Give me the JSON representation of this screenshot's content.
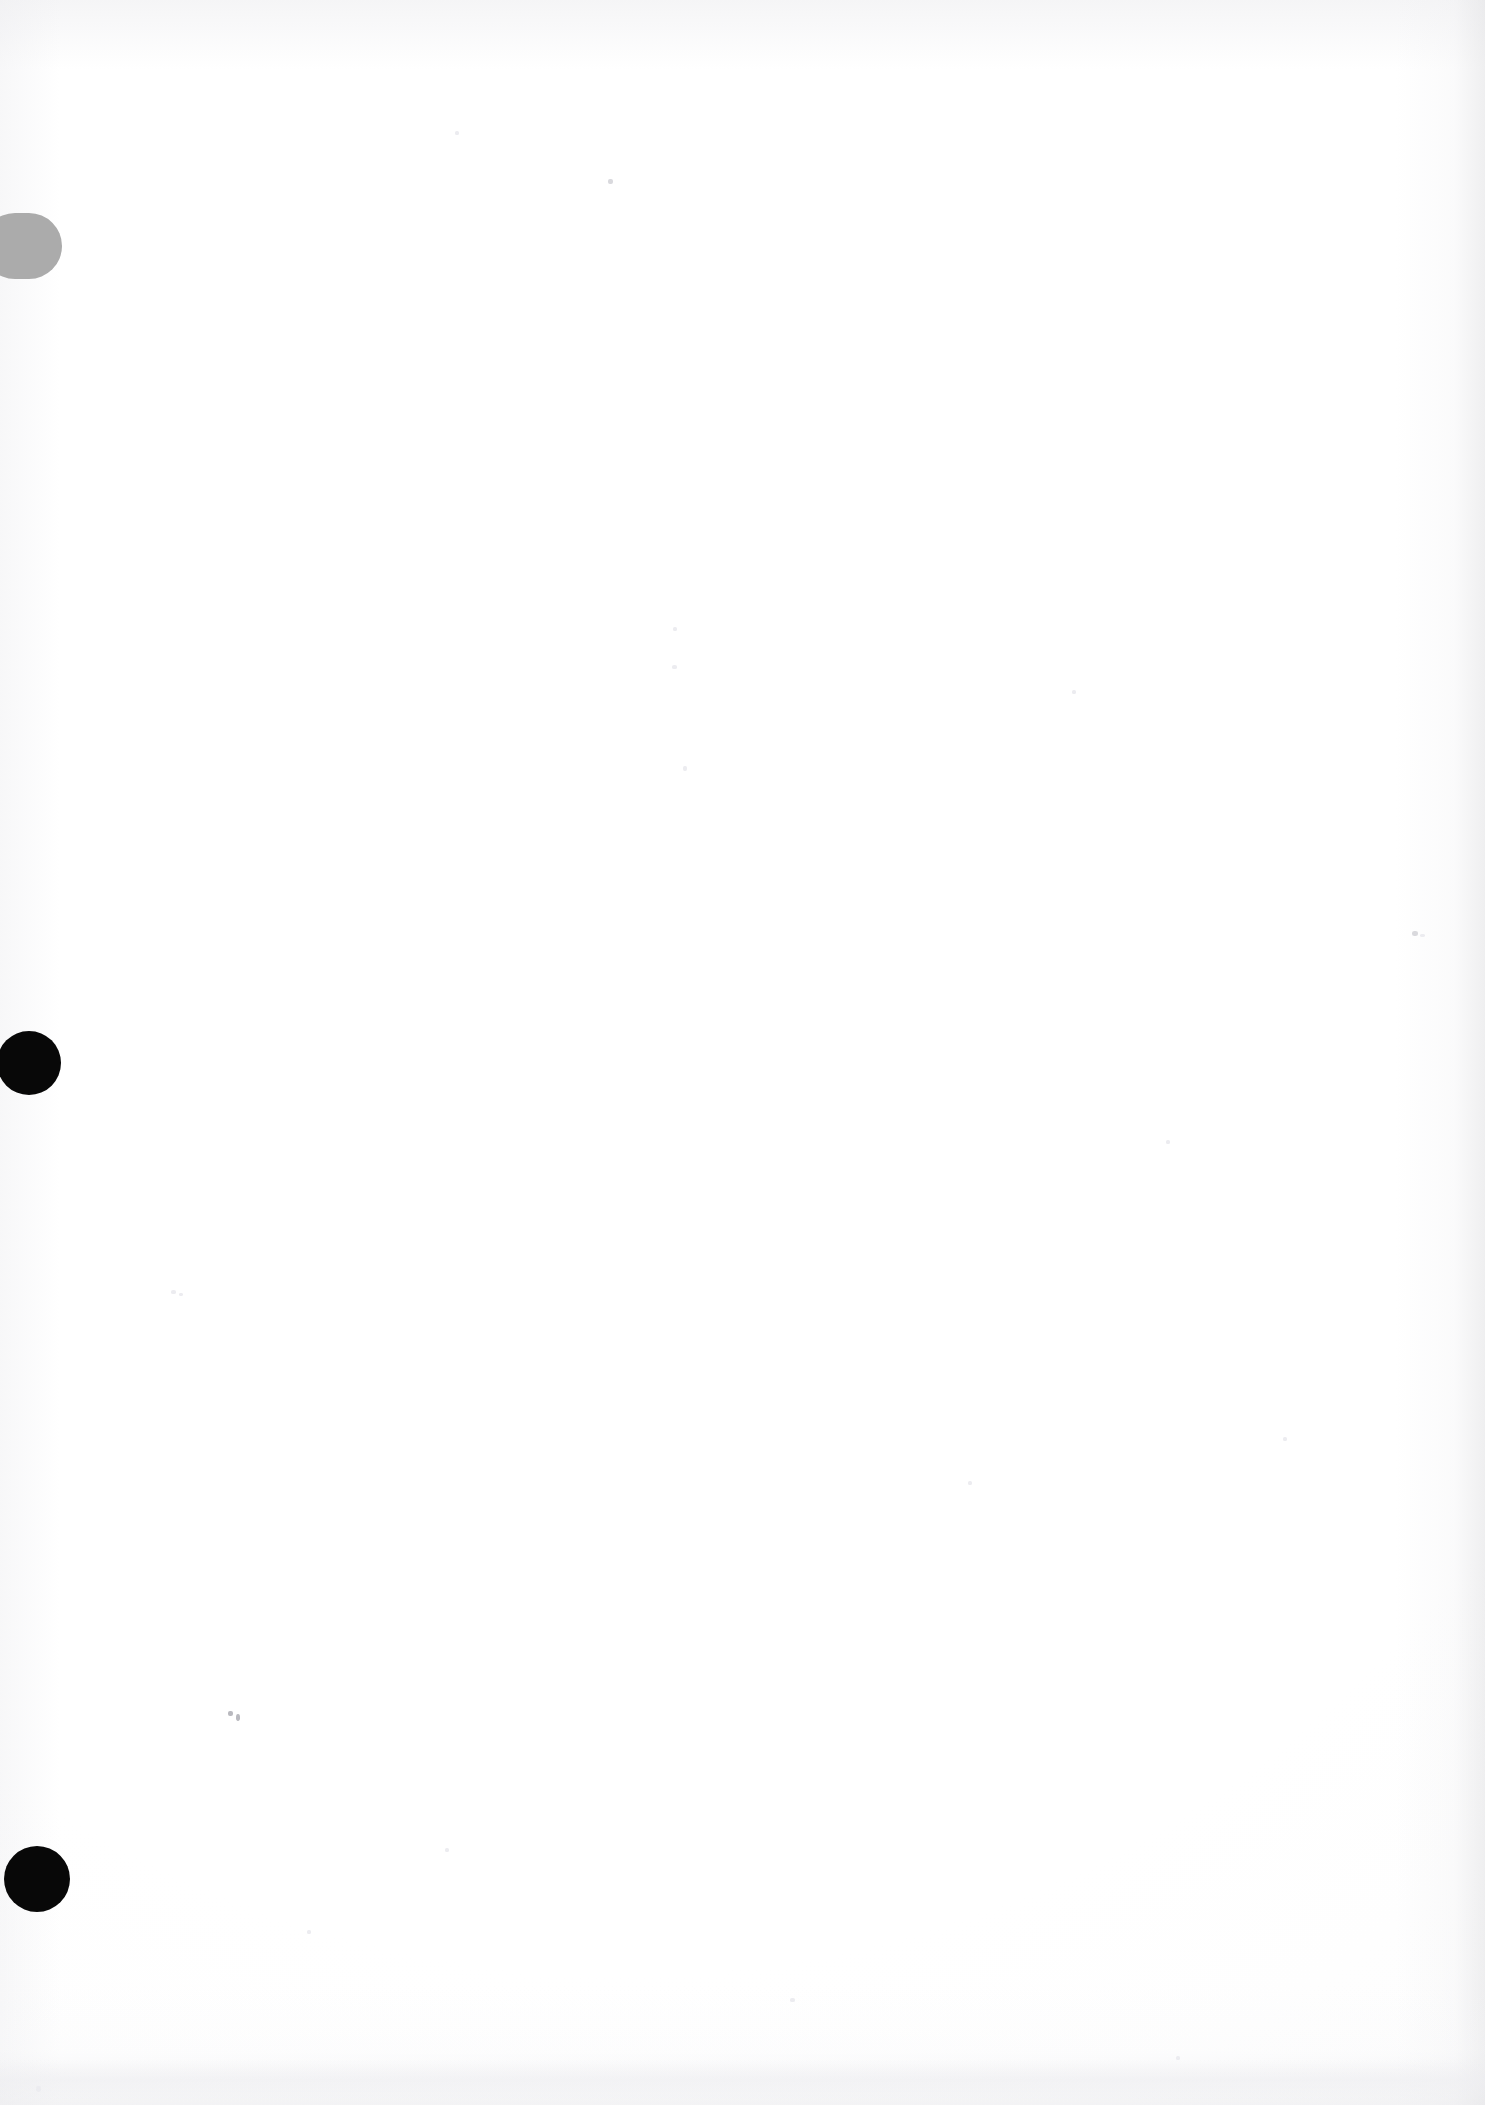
{
  "page": {
    "kind": "scanned-blank-page",
    "width": 1485,
    "height": 2105,
    "background_color": "#ffffff",
    "body_text": "",
    "has_visible_text": false,
    "note": ""
  },
  "marks": {
    "pill": {
      "name": "grey-pill-mark",
      "label": "",
      "color": "#ababab",
      "x": -18,
      "y": 213,
      "width": 80,
      "height": 66
    },
    "dots": [
      {
        "name": "black-dot-upper",
        "label": "",
        "color": "#080808",
        "cx": 29,
        "cy": 1063,
        "r": 32
      },
      {
        "name": "black-dot-lower",
        "label": "",
        "color": "#080808",
        "cx": 37,
        "cy": 1879,
        "r": 33
      }
    ],
    "specks": [
      {
        "x": 228,
        "y": 1711,
        "w": 5,
        "h": 5,
        "tone": "dark"
      },
      {
        "x": 236,
        "y": 1714,
        "w": 4,
        "h": 7,
        "tone": "dark"
      },
      {
        "x": 608,
        "y": 179,
        "w": 5,
        "h": 5,
        "tone": "normal"
      },
      {
        "x": 1412,
        "y": 931,
        "w": 6,
        "h": 5,
        "tone": "normal"
      },
      {
        "x": 1420,
        "y": 934,
        "w": 5,
        "h": 3,
        "tone": "faint"
      },
      {
        "x": 455,
        "y": 131,
        "w": 4,
        "h": 4,
        "tone": "faint"
      },
      {
        "x": 1072,
        "y": 690,
        "w": 4,
        "h": 4,
        "tone": "faint"
      },
      {
        "x": 673,
        "y": 627,
        "w": 4,
        "h": 4,
        "tone": "faint"
      },
      {
        "x": 672,
        "y": 665,
        "w": 5,
        "h": 4,
        "tone": "faint"
      },
      {
        "x": 683,
        "y": 766,
        "w": 4,
        "h": 5,
        "tone": "faint"
      },
      {
        "x": 171,
        "y": 1290,
        "w": 5,
        "h": 4,
        "tone": "faint"
      },
      {
        "x": 179,
        "y": 1293,
        "w": 4,
        "h": 3,
        "tone": "faint"
      },
      {
        "x": 968,
        "y": 1481,
        "w": 4,
        "h": 4,
        "tone": "faint"
      },
      {
        "x": 1283,
        "y": 1437,
        "w": 4,
        "h": 4,
        "tone": "faint"
      },
      {
        "x": 307,
        "y": 1930,
        "w": 4,
        "h": 4,
        "tone": "faint"
      },
      {
        "x": 790,
        "y": 1998,
        "w": 5,
        "h": 4,
        "tone": "faint"
      },
      {
        "x": 36,
        "y": 2086,
        "w": 5,
        "h": 6,
        "tone": "faint"
      },
      {
        "x": 1176,
        "y": 2056,
        "w": 4,
        "h": 4,
        "tone": "faint"
      },
      {
        "x": 1166,
        "y": 1140,
        "w": 4,
        "h": 4,
        "tone": "faint"
      },
      {
        "x": 445,
        "y": 1848,
        "w": 4,
        "h": 4,
        "tone": "faint"
      }
    ],
    "foot_band": {
      "name": "scan-shading-band",
      "y": 2060
    }
  }
}
